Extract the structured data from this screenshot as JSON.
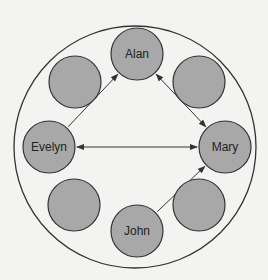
{
  "diagram": {
    "type": "network",
    "colors": {
      "background": "#f3f3f1",
      "node_fill": "#a8a8a8",
      "node_stroke": "#333333",
      "edge": "#333333",
      "outer_ring": "#333333"
    },
    "outer_ring": {
      "cx": 135,
      "cy": 147,
      "r": 121
    },
    "nodes": [
      {
        "id": "alan",
        "label": "Alan",
        "cx": 137,
        "cy": 54,
        "r": 26
      },
      {
        "id": "tr",
        "label": "",
        "cx": 199,
        "cy": 82,
        "r": 26
      },
      {
        "id": "mary",
        "label": "Mary",
        "cx": 225,
        "cy": 147,
        "r": 26
      },
      {
        "id": "br",
        "label": "",
        "cx": 199,
        "cy": 205,
        "r": 26
      },
      {
        "id": "john",
        "label": "John",
        "cx": 137,
        "cy": 231,
        "r": 26
      },
      {
        "id": "bl",
        "label": "",
        "cx": 74,
        "cy": 205,
        "r": 26
      },
      {
        "id": "evelyn",
        "label": "Evelyn",
        "cx": 49,
        "cy": 147,
        "r": 26
      },
      {
        "id": "tl",
        "label": "",
        "cx": 75,
        "cy": 82,
        "r": 26
      }
    ],
    "edges": [
      {
        "from": "evelyn",
        "to": "alan",
        "direction": "forward"
      },
      {
        "from": "alan",
        "to": "mary",
        "direction": "both"
      },
      {
        "from": "evelyn",
        "to": "mary",
        "direction": "both"
      },
      {
        "from": "john",
        "to": "mary",
        "direction": "forward"
      }
    ]
  }
}
